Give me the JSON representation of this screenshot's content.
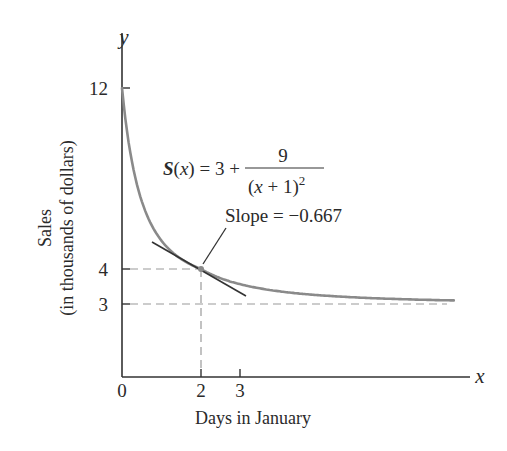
{
  "chart_data": {
    "type": "line",
    "title": "",
    "xlabel": "Days in January",
    "ylabel_line1": "Sales",
    "ylabel_line2": "(in thousands of dollars)",
    "x_axis_symbol": "x",
    "y_axis_symbol": "y",
    "x_ticks": [
      "0",
      "2",
      "3"
    ],
    "y_ticks": [
      "12",
      "4",
      "3"
    ],
    "function_label": {
      "lhs": "S(x) = 3 + ",
      "numerator": "9",
      "denominator": "(x + 1)",
      "exponent": "2"
    },
    "annotation": "Slope = −0.667",
    "series": [
      {
        "name": "S(x) = 3 + 9/(x+1)^2",
        "x": [
          0,
          0.5,
          1,
          1.5,
          2,
          3,
          4,
          5,
          6,
          7,
          8,
          8.4
        ],
        "y": [
          12,
          7,
          5.25,
          4.44,
          4,
          3.5625,
          3.36,
          3.25,
          3.18,
          3.14,
          3.11,
          3.1
        ]
      }
    ],
    "tangent_line": {
      "point": [
        2,
        4
      ],
      "slope": -0.667,
      "x_range": [
        0.75,
        3.1
      ]
    },
    "reference_lines": [
      {
        "type": "horizontal",
        "y": 4,
        "style": "dashed",
        "x_range": [
          0,
          2
        ]
      },
      {
        "type": "horizontal",
        "y": 3,
        "style": "dashed",
        "x_range": [
          0,
          8.4
        ]
      },
      {
        "type": "vertical",
        "x": 2,
        "style": "dashed",
        "y_range": [
          0,
          4
        ]
      }
    ],
    "xlim": [
      0,
      9
    ],
    "ylim": [
      0,
      13.5
    ],
    "grid": false,
    "colors": {
      "curve": "#8a8a8a",
      "tangent": "#333333",
      "axes": "#333333",
      "dash": "#9a9a9a"
    }
  }
}
